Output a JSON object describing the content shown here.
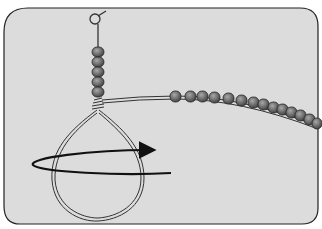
{
  "illustration": {
    "subject": "bead loop wire-wrapping step",
    "colors": {
      "background": "#ffffff",
      "panel": "#dcdcdc",
      "panel_border": "#222222",
      "bead_fill": "#6e6e6e",
      "bead_highlight": "#9a9a9a",
      "wire": "#333333",
      "arrow": "#111111"
    },
    "elements": {
      "panel": "rounded-rect-panel",
      "top_loop": "wire-eye-loop",
      "vertical_beads": 5,
      "wire_loop": "teardrop-wire-loop",
      "wrap_coil": "wire-wrap-coil",
      "strand_beads": 14,
      "rotation_arrow": "circular-arrow-clockwise"
    }
  }
}
